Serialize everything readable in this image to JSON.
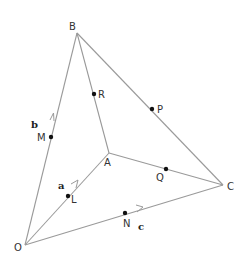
{
  "diagram": {
    "type": "geometry-vector-diagram",
    "vertices": {
      "O": {
        "label": "O",
        "x": 25,
        "y": 245
      },
      "A": {
        "label": "A",
        "x": 109,
        "y": 153
      },
      "B": {
        "label": "B",
        "x": 77,
        "y": 33
      },
      "C": {
        "label": "C",
        "x": 223,
        "y": 185
      }
    },
    "midpoints": {
      "R": {
        "label": "R",
        "on": "AB"
      },
      "P": {
        "label": "P",
        "on": "BC"
      },
      "M": {
        "label": "M",
        "on": "OB"
      },
      "L": {
        "label": "L",
        "on": "OA"
      },
      "Q": {
        "label": "Q",
        "on": "AC"
      },
      "N": {
        "label": "N",
        "on": "OC"
      }
    },
    "vectors": {
      "a": {
        "label": "a",
        "along": "OA"
      },
      "b": {
        "label": "b",
        "along": "OB"
      },
      "c": {
        "label": "c",
        "along": "OC"
      }
    },
    "edges": [
      "OA",
      "OB",
      "OC",
      "AB",
      "AC",
      "BC"
    ],
    "colors": {
      "line": "#9a9a9a",
      "point": "#111111",
      "text": "#333333"
    }
  }
}
